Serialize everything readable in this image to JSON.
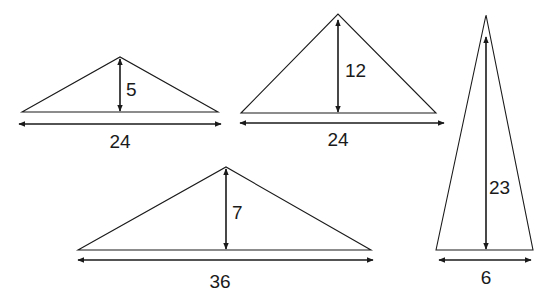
{
  "diagram": {
    "type": "triangles-with-base-and-height",
    "stroke_color": "#1a1a1a",
    "background": "#ffffff",
    "triangles": [
      {
        "id": "t1",
        "base": "24",
        "height": "5",
        "apex": [
          120,
          57
        ],
        "base_left": [
          22,
          112
        ],
        "base_right": [
          218,
          112
        ],
        "height_label_pos": [
          127,
          96
        ],
        "base_arrow_y": 124,
        "base_arrow_x": [
          19,
          221
        ],
        "base_label_pos": [
          120,
          148
        ]
      },
      {
        "id": "t2",
        "base": "24",
        "height": "12",
        "apex": [
          338,
          14
        ],
        "base_left": [
          241,
          113
        ],
        "base_right": [
          436,
          113
        ],
        "height_label_pos": [
          345,
          77
        ],
        "base_arrow_y": 123,
        "base_arrow_x": [
          240,
          444
        ],
        "base_label_pos": [
          338,
          146
        ]
      },
      {
        "id": "t3",
        "base": "6",
        "height": "23",
        "apex": [
          486,
          15
        ],
        "base_left": [
          436,
          250
        ],
        "base_right": [
          533,
          250
        ],
        "height_label_pos": [
          489,
          194
        ],
        "base_arrow_y": 260,
        "base_arrow_x": [
          439,
          531
        ],
        "base_label_pos": [
          486,
          284
        ]
      },
      {
        "id": "t4",
        "base": "36",
        "height": "7",
        "apex": [
          226,
          167
        ],
        "base_left": [
          78,
          250
        ],
        "base_right": [
          371,
          250
        ],
        "height_label_pos": [
          232,
          219
        ],
        "base_arrow_y": 260,
        "base_arrow_x": [
          78,
          373
        ],
        "base_label_pos": [
          220,
          288
        ]
      }
    ]
  }
}
